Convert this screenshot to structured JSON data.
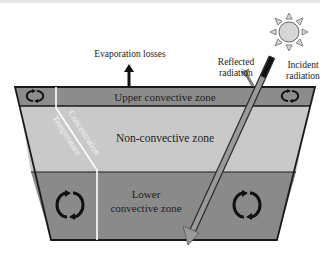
{
  "diagram": {
    "type": "solar-pond-cross-section",
    "labels": {
      "evaporation": "Evaporation losses",
      "reflected_line1": "Reflected",
      "reflected_line2": "radiation",
      "incident_line1": "Incident",
      "incident_line2": "radiation",
      "upper_zone": "Upper convective zone",
      "non_convective_zone": "Non-convective zone",
      "lower_zone_line1": "Lower",
      "lower_zone_line2": "convective zone",
      "concentration": "Concentration",
      "temperature": "Temperature"
    },
    "zones": [
      {
        "name": "Upper convective zone",
        "color": "#8c8c8c"
      },
      {
        "name": "Non-convective zone",
        "color": "#c9c9c9"
      },
      {
        "name": "Lower convective zone",
        "color": "#8a8a8a"
      }
    ],
    "colors": {
      "outline": "#1a1a1a",
      "profile_line": "#ffffff",
      "ray": "#8a8a8a",
      "sun_fill": "#d6d6d6",
      "sun_stroke": "#6a6a6a",
      "text": "#222222"
    },
    "icons": {
      "convection": "circular-arrows-icon",
      "sun": "sun-icon",
      "evaporation_arrow": "arrow-up-icon"
    }
  }
}
